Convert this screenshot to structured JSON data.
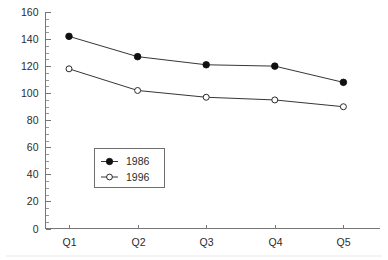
{
  "chart_data": {
    "type": "line",
    "title": "",
    "subtitle": "",
    "xlabel": "",
    "ylabel": "",
    "categories": [
      "Q1",
      "Q2",
      "Q3",
      "Q4",
      "Q5"
    ],
    "series": [
      {
        "name": "1986",
        "marker": "filled-circle",
        "values": [
          142,
          127,
          121,
          120,
          108
        ]
      },
      {
        "name": "1996",
        "marker": "open-circle",
        "values": [
          118,
          102,
          97,
          95,
          90
        ]
      }
    ],
    "ylim": [
      0,
      160
    ],
    "y_major_ticks": [
      0,
      20,
      40,
      60,
      80,
      100,
      120,
      140,
      160
    ],
    "y_tick_labels": [
      "0",
      "20",
      "40",
      "60",
      "80",
      "100",
      "120",
      "140",
      "160"
    ],
    "y_minor_tick_step": 5,
    "x_tick_labels": [
      "Q1",
      "Q2",
      "Q3",
      "Q4",
      "Q5"
    ],
    "grid": false,
    "legend_position": "center-left-inside",
    "legend_entries": [
      "1986",
      "1996"
    ],
    "colors": {
      "axis": "#767676",
      "line": "#2a2a2a",
      "marker_filled": "#101010",
      "marker_open_fill": "#ffffff",
      "legend_border": "#6e6e6e",
      "background": "#ffffff",
      "text": "#2b2b2b"
    }
  }
}
